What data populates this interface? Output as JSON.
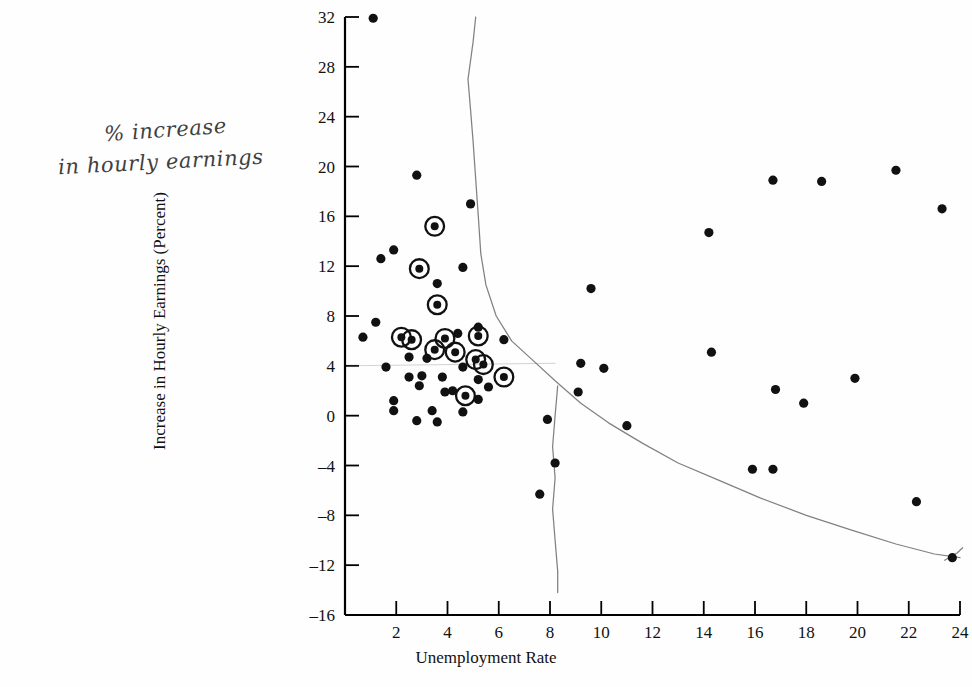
{
  "figure": {
    "xlabel": "Unemployment Rate",
    "ylabel": "Increase in Hourly Earnings (Percent)",
    "handwritten_note_line1": "% increase",
    "handwritten_note_line2": "in hourly earnings",
    "point_color": "#111111",
    "curve_color": "#6b6b6b",
    "axis_color": "#000000",
    "background": "#fefefe"
  },
  "chart_data": {
    "type": "scatter",
    "title": "",
    "xlabel": "Unemployment Rate",
    "ylabel": "Increase in Hourly Earnings (Percent)",
    "xlim": [
      0,
      24
    ],
    "ylim": [
      -16,
      32
    ],
    "xticks": [
      2,
      4,
      6,
      8,
      10,
      12,
      14,
      16,
      18,
      20,
      22,
      24
    ],
    "yticks": [
      -16,
      -12,
      -8,
      -4,
      0,
      4,
      8,
      12,
      16,
      20,
      24,
      28,
      32
    ],
    "grid": false,
    "legend": null,
    "series": [
      {
        "name": "Observations",
        "marker": "filled-circle",
        "points": [
          [
            1.1,
            31.9
          ],
          [
            2.8,
            19.3
          ],
          [
            4.9,
            17.0
          ],
          [
            1.9,
            13.3
          ],
          [
            3.5,
            15.2
          ],
          [
            2.9,
            11.8
          ],
          [
            4.6,
            11.9
          ],
          [
            1.4,
            12.6
          ],
          [
            3.6,
            10.6
          ],
          [
            3.6,
            8.9
          ],
          [
            5.2,
            7.1
          ],
          [
            1.2,
            7.5
          ],
          [
            0.7,
            6.3
          ],
          [
            2.2,
            6.3
          ],
          [
            2.6,
            6.1
          ],
          [
            3.9,
            6.2
          ],
          [
            5.2,
            6.4
          ],
          [
            6.2,
            6.1
          ],
          [
            4.4,
            6.6
          ],
          [
            2.5,
            4.7
          ],
          [
            3.2,
            4.6
          ],
          [
            3.5,
            5.3
          ],
          [
            4.3,
            5.1
          ],
          [
            5.1,
            4.5
          ],
          [
            5.4,
            4.1
          ],
          [
            6.2,
            3.1
          ],
          [
            1.6,
            3.9
          ],
          [
            2.5,
            3.1
          ],
          [
            3.0,
            3.2
          ],
          [
            3.8,
            3.1
          ],
          [
            4.6,
            3.9
          ],
          [
            5.2,
            2.9
          ],
          [
            2.9,
            2.4
          ],
          [
            3.9,
            1.9
          ],
          [
            4.7,
            1.6
          ],
          [
            5.2,
            1.3
          ],
          [
            1.9,
            1.2
          ],
          [
            1.9,
            0.4
          ],
          [
            3.4,
            0.4
          ],
          [
            4.6,
            0.3
          ],
          [
            2.8,
            -0.4
          ],
          [
            3.6,
            -0.5
          ],
          [
            5.6,
            2.3
          ],
          [
            4.2,
            2.0
          ],
          [
            7.9,
            -0.3
          ],
          [
            8.2,
            -3.8
          ],
          [
            7.6,
            -6.3
          ],
          [
            9.6,
            10.2
          ],
          [
            9.2,
            4.2
          ],
          [
            10.1,
            3.8
          ],
          [
            9.1,
            1.9
          ],
          [
            11.0,
            -0.8
          ],
          [
            14.2,
            14.7
          ],
          [
            14.3,
            5.1
          ],
          [
            16.7,
            18.9
          ],
          [
            18.6,
            18.8
          ],
          [
            21.5,
            19.7
          ],
          [
            23.3,
            16.6
          ],
          [
            16.8,
            2.1
          ],
          [
            17.9,
            1.0
          ],
          [
            19.9,
            3.0
          ],
          [
            15.9,
            -4.3
          ],
          [
            16.7,
            -4.3
          ],
          [
            22.3,
            -6.9
          ],
          [
            23.7,
            -11.4
          ]
        ]
      },
      {
        "name": "Highlighted Observations",
        "marker": "circled-dot",
        "points": [
          [
            3.5,
            15.2
          ],
          [
            2.9,
            11.8
          ],
          [
            3.6,
            8.9
          ],
          [
            2.2,
            6.3
          ],
          [
            2.6,
            6.1
          ],
          [
            3.9,
            6.2
          ],
          [
            5.2,
            6.4
          ],
          [
            3.5,
            5.3
          ],
          [
            4.3,
            5.1
          ],
          [
            5.1,
            4.5
          ],
          [
            5.4,
            4.1
          ],
          [
            6.2,
            3.1
          ],
          [
            4.7,
            1.6
          ]
        ]
      }
    ],
    "annotations": [
      {
        "kind": "hand-drawn-curve",
        "name": "phillips-curve",
        "description": "Downward sloping hand-drawn Phillips curve",
        "path_points": [
          [
            5.1,
            32.0
          ],
          [
            5.0,
            30.0
          ],
          [
            4.8,
            27.0
          ],
          [
            4.9,
            24.5
          ],
          [
            5.0,
            22.0
          ],
          [
            5.1,
            19.0
          ],
          [
            5.2,
            16.0
          ],
          [
            5.3,
            13.0
          ],
          [
            5.5,
            10.5
          ],
          [
            5.9,
            8.0
          ],
          [
            6.5,
            6.0
          ],
          [
            7.3,
            4.5
          ],
          [
            8.2,
            2.8
          ],
          [
            9.2,
            1.0
          ],
          [
            10.3,
            -0.6
          ],
          [
            11.6,
            -2.2
          ],
          [
            13.0,
            -3.8
          ],
          [
            14.6,
            -5.2
          ],
          [
            16.2,
            -6.6
          ],
          [
            18.0,
            -8.0
          ],
          [
            19.8,
            -9.2
          ],
          [
            21.5,
            -10.3
          ],
          [
            23.0,
            -11.1
          ],
          [
            24.0,
            -11.4
          ]
        ]
      },
      {
        "kind": "hand-drawn-curve",
        "name": "vertical-natural-rate-line",
        "description": "Near-vertical hand-drawn line at about 8 percent unemployment",
        "path_points": [
          [
            8.3,
            2.4
          ],
          [
            8.2,
            0.0
          ],
          [
            8.1,
            -2.5
          ],
          [
            8.2,
            -5.0
          ],
          [
            8.1,
            -7.5
          ],
          [
            8.2,
            -10.0
          ],
          [
            8.3,
            -12.5
          ],
          [
            8.3,
            -14.2
          ]
        ]
      },
      {
        "kind": "hand-drawn-curve",
        "name": "horizontal-faint-guide",
        "description": "Faint horizontal guide near 4 percent earnings increase",
        "path_points": [
          [
            0.1,
            4.0
          ],
          [
            4.0,
            4.1
          ],
          [
            8.0,
            4.2
          ],
          [
            8.2,
            4.2
          ]
        ]
      },
      {
        "kind": "hand-drawn-curve",
        "name": "right-tail-tick",
        "description": "Short upward hand stroke at far right end of curve",
        "path_points": [
          [
            23.4,
            -11.6
          ],
          [
            23.9,
            -11.0
          ],
          [
            24.1,
            -10.6
          ]
        ]
      }
    ]
  }
}
